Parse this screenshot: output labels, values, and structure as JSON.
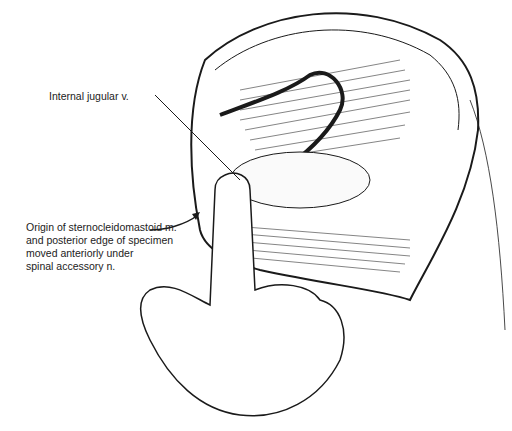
{
  "figure": {
    "type": "surgical anatomical illustration",
    "labels": [
      {
        "id": "ijv",
        "text": "Internal jugular v."
      },
      {
        "id": "scm_lines",
        "lines": [
          "Origin of sternocleidomastoid m.",
          "and posterior edge of specimen",
          "moved anteriorly under",
          "spinal accessory n."
        ]
      }
    ],
    "colors": {
      "ink": "#1a1a1a",
      "background": "#ffffff"
    }
  }
}
